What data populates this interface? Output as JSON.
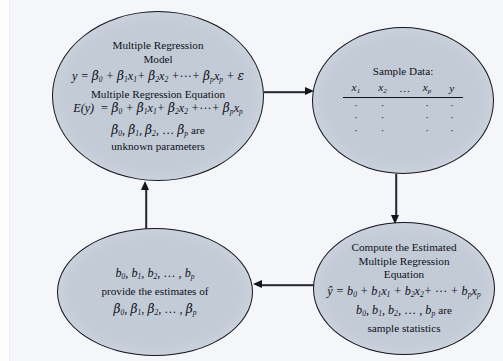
{
  "diagram": {
    "background_color": "#f4f6fa",
    "node_fill_color": "#c3cbd7",
    "node_border_color": "#14161f",
    "arrow_color": "#14161f"
  },
  "nodes": {
    "model": {
      "id": "multiple-regression-model",
      "title_line1": "Multiple Regression",
      "title_line2": "Model",
      "model_equation": "y = β0 + β1x1 + β2x2 + ··· + βpxp + ε",
      "equation_heading": "Multiple Regression Equation",
      "expected_equation": "E(y) = β0 + β1x1 + β2x2 + ··· + βpxp",
      "parameters_line": "β0, β1, β2, … βp are",
      "parameters_caption": "unknown parameters"
    },
    "sample": {
      "id": "sample-data",
      "title": "Sample Data:",
      "columns": [
        "x1",
        "x2",
        "…",
        "xp",
        "y"
      ],
      "column_labels": [
        "x",
        "x",
        "…",
        "x",
        "y"
      ],
      "column_subscripts": [
        "1",
        "2",
        "",
        "p",
        ""
      ],
      "rows": [
        [
          ".",
          ".",
          ".",
          "."
        ],
        [
          ".",
          ".",
          ".",
          "."
        ],
        [
          ".",
          ".",
          ".",
          "."
        ]
      ]
    },
    "compute": {
      "id": "compute-estimated-equation",
      "title_line1": "Compute the Estimated",
      "title_line2": "Multiple Regression",
      "title_line3": "Equation",
      "estimated_equation": "ŷ = b0 + b1x1 + b2x2 + ··· + bpxp",
      "statistics_line": "b0, b1, b2, … , bp are",
      "statistics_caption": "sample statistics"
    },
    "estimates": {
      "id": "sample-statistics-estimates",
      "coefficients_line": "b0, b1, b2, … , bp",
      "middle_text": "provide the estimates of",
      "parameters_line": "β0, β1, β2, … , βp"
    }
  },
  "arrows": [
    {
      "id": "model-to-sample",
      "from": "model",
      "to": "sample",
      "direction": "right"
    },
    {
      "id": "sample-to-compute",
      "from": "sample",
      "to": "compute",
      "direction": "down"
    },
    {
      "id": "compute-to-estimates",
      "from": "compute",
      "to": "estimates",
      "direction": "left"
    },
    {
      "id": "estimates-to-model",
      "from": "estimates",
      "to": "model",
      "direction": "up"
    }
  ]
}
